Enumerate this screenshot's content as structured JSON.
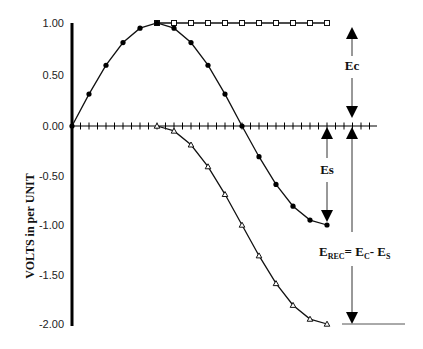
{
  "chart_data": {
    "type": "line",
    "title": "",
    "xlabel": "",
    "ylabel": "VOLTS in per UNIT",
    "ylim": [
      -2.0,
      1.0
    ],
    "yticks": [
      "1.00",
      "0.50",
      "0.00",
      "-0.50",
      "-1.00",
      "-1.50",
      "-2.00"
    ],
    "grid": false,
    "legend": null,
    "x": [
      0,
      1,
      2,
      3,
      4,
      5,
      6,
      7,
      8,
      9,
      10,
      11,
      12,
      13,
      14,
      15
    ],
    "series": [
      {
        "name": "Ec",
        "marker": "open-square",
        "x": [
          5,
          6,
          7,
          8,
          9,
          10,
          11,
          12,
          13,
          14,
          15
        ],
        "values": [
          1.0,
          1.0,
          1.0,
          1.0,
          1.0,
          1.0,
          1.0,
          1.0,
          1.0,
          1.0,
          1.0
        ]
      },
      {
        "name": "Es",
        "marker": "filled-circle",
        "x": [
          0,
          1,
          2,
          3,
          4,
          5,
          6,
          7,
          8,
          9,
          10,
          11,
          12,
          13,
          14,
          15
        ],
        "values": [
          0.0,
          0.31,
          0.59,
          0.81,
          0.95,
          1.0,
          0.95,
          0.81,
          0.59,
          0.31,
          0.0,
          -0.31,
          -0.59,
          -0.81,
          -0.95,
          -1.0
        ]
      },
      {
        "name": "E_REC",
        "marker": "open-triangle",
        "x": [
          5,
          6,
          7,
          8,
          9,
          10,
          11,
          12,
          13,
          14,
          15
        ],
        "values": [
          0.0,
          -0.05,
          -0.19,
          -0.41,
          -0.69,
          -1.0,
          -1.31,
          -1.59,
          -1.81,
          -1.95,
          -2.0
        ]
      }
    ],
    "annotations": [
      {
        "label": "Ec",
        "type": "double-arrow",
        "from": 1.0,
        "to": 0.0
      },
      {
        "label": "Es",
        "type": "double-arrow",
        "from": 0.0,
        "to": -1.0
      },
      {
        "label": "E_REC = E_C - E_S",
        "type": "double-arrow",
        "from": 0.0,
        "to": -2.0
      }
    ]
  },
  "labels": {
    "ylabel": "VOLTS in per UNIT",
    "ec": "Ec",
    "es": "Es",
    "erec_main": "E",
    "erec_sub": "REC",
    "eq": "= E",
    "ec_sub": "C",
    "minus": "- E",
    "es_sub": "S"
  }
}
